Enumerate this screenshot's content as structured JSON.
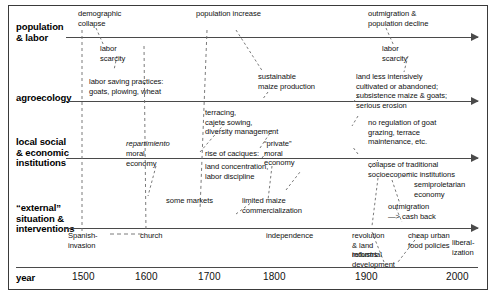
{
  "diagram": {
    "rows": [
      {
        "id": "population-labor",
        "label": "population\n& labor"
      },
      {
        "id": "agroecology",
        "label": "agroecology"
      },
      {
        "id": "local-institutions",
        "label": "local social\n& economic\ninstitutions"
      },
      {
        "id": "external",
        "label": "“external”\nsituation &\ninterventions"
      },
      {
        "id": "year",
        "label": "year"
      }
    ],
    "year_axis": {
      "ticks": [
        "1500",
        "1600",
        "1700",
        "1800",
        "1900",
        "2000"
      ]
    },
    "annotations": [
      {
        "id": "demographic-collapse",
        "text": "demographic\ncollapse"
      },
      {
        "id": "population-increase",
        "text": "population increase"
      },
      {
        "id": "outmigration-decline",
        "text": "outmigration &\npopulation decline"
      },
      {
        "id": "labor-scarcity-1",
        "text": "labor\nscarcity"
      },
      {
        "id": "labor-scarcity-2",
        "text": "labor\nscarcity"
      },
      {
        "id": "labor-saving-practices",
        "text": "labor saving practices:\ngoats, plowing, wheat"
      },
      {
        "id": "sustainable-maize",
        "text": "sustainable\nmaize production"
      },
      {
        "id": "land-less-intensively",
        "text": "land less intensively\ncultivated or abandoned;\nsubsistence maize & goats;"
      },
      {
        "id": "serious-erosion",
        "text": "serious erosion"
      },
      {
        "id": "terracing-cajete",
        "text": "terracing,\ncajete sowing,\ndiversity management"
      },
      {
        "id": "no-regulation-goat",
        "text": "no regulation of goat\ngrazing, terrace\nmaintenance, etc."
      },
      {
        "id": "repartimiento",
        "text": "repartimiento"
      },
      {
        "id": "repartimiento-moral",
        "text": "moral\neconomy"
      },
      {
        "id": "private-moral",
        "text": "“private”\nmoral\neconomy"
      },
      {
        "id": "rise-of-caciques",
        "text": "rise of caciques:"
      },
      {
        "id": "land-concentration",
        "text": "land concentration,\nlabor discipline"
      },
      {
        "id": "collapse-traditional",
        "text": "collapse of traditional\nsocioeconomic institutions"
      },
      {
        "id": "semiproletarian",
        "text": "semiproletarian\neconomy"
      },
      {
        "id": "outmigration-cash",
        "text": "outmigration\n—> cash back"
      },
      {
        "id": "some-markets",
        "text": "some markets"
      },
      {
        "id": "limited-maize",
        "text": "limited maize\ncommercialization"
      },
      {
        "id": "spanish-invasion",
        "text": "Spanish-\ninvasion"
      },
      {
        "id": "church",
        "text": "church"
      },
      {
        "id": "independence",
        "text": "independence"
      },
      {
        "id": "revolution-land-reforms",
        "text": "revolution\n& land\nreforms"
      },
      {
        "id": "cheap-urban-food",
        "text": "cheap urban\nfood policies"
      },
      {
        "id": "liberalization",
        "text": "liberal-\nization"
      },
      {
        "id": "industrial-development",
        "text": "industrial\ndevelopment"
      }
    ],
    "colors": {
      "line": "#4a4a4a",
      "text": "#111111",
      "border": "#3a3a3a",
      "background": "#ffffff"
    }
  }
}
